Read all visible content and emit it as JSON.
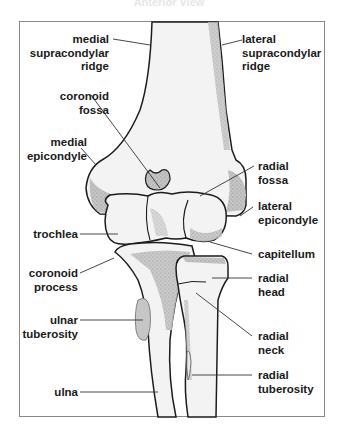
{
  "title": "Anterior View",
  "colors": {
    "bone_fill": "#f1f1f1",
    "shade": "#b9b9b9",
    "tuberosity": "#c8c8c8",
    "outline": "#1c1c1c",
    "leader": "#333333",
    "frame": "#8a8a8a"
  },
  "labels": {
    "medial_supracondylar_ridge": "medial\nsupracondylar\nridge",
    "coronoid_fossa": "coronoid\nfossa",
    "medial_epicondyle": "medial\nepicondyle",
    "trochlea": "trochlea",
    "coronoid_process": "coronoid\nprocess",
    "ulnar_tuberosity": "ulnar\ntuberosity",
    "ulna": "ulna",
    "lateral_supracondylar_ridge": "lateral\nsupracondylar\nridge",
    "radial_fossa": "radial\nfossa",
    "lateral_epicondyle": "lateral\nepicondyle",
    "capitellum": "capitellum",
    "radial_head": "radial\nhead",
    "radial_neck": "radial\nneck",
    "radial_tuberosity": "radial\ntuberosity"
  }
}
